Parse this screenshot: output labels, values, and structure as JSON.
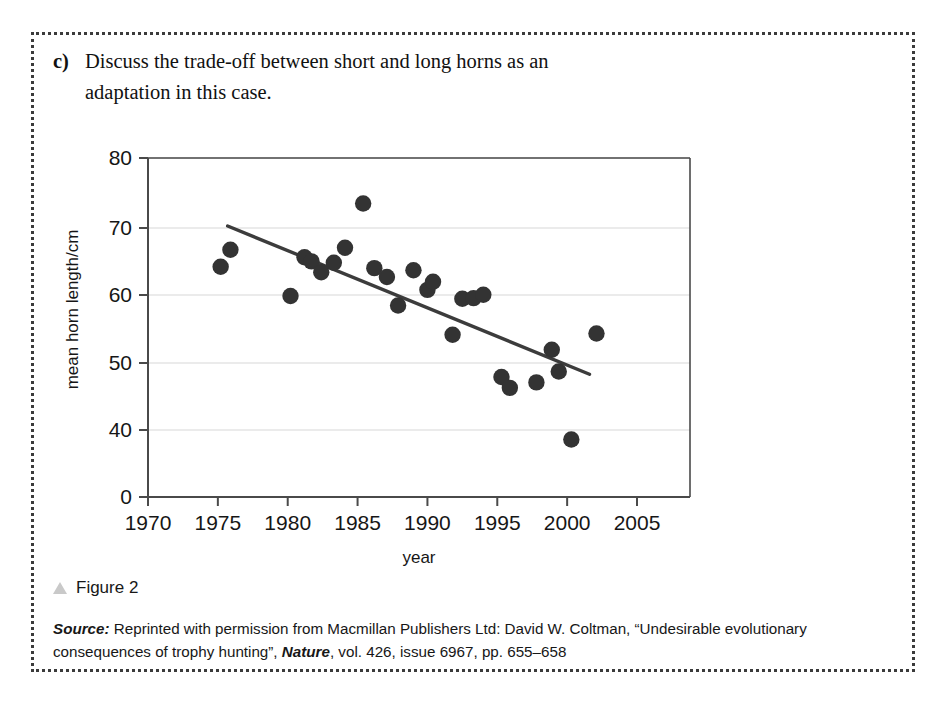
{
  "question": {
    "label": "c)",
    "line1": "Discuss the trade-off between short and long horns as an",
    "line2": "adaptation in this case."
  },
  "caption": {
    "icon": "triangle-icon",
    "text": "Figure 2"
  },
  "source": {
    "prefix": "Source:",
    "part1": " Reprinted with permission from Macmillan Publishers Ltd: David W. Coltman, “Undesirable evolutionary consequences of trophy hunting”, ",
    "journal": "Nature",
    "part2": ", vol. 426, issue 6967, pp. 655–658"
  },
  "colors": {
    "marker": "#333333",
    "trendline": "#3c3c3c",
    "gridline": "#d8d8d8",
    "axis": "#4a4a4a",
    "border": "#3b3b3b",
    "icon": "#c9c9c9"
  },
  "chart_data": {
    "type": "scatter",
    "title": "",
    "xlabel": "year",
    "ylabel": "mean horn length/cm",
    "xlim": [
      1970,
      2005
    ],
    "ylim": [
      0,
      80
    ],
    "xticks": [
      1970,
      1975,
      1980,
      1985,
      1990,
      1995,
      2000,
      2005
    ],
    "yticks": [
      0,
      40,
      50,
      60,
      70,
      80
    ],
    "y_axis_break": true,
    "grid": "horizontal",
    "legend": "none",
    "series": [
      {
        "name": "mean horn length",
        "marker": "filled-circle",
        "points": [
          {
            "x": 1975.2,
            "y": 64.0
          },
          {
            "x": 1975.9,
            "y": 66.5
          },
          {
            "x": 1980.2,
            "y": 59.7
          },
          {
            "x": 1981.2,
            "y": 65.4
          },
          {
            "x": 1981.7,
            "y": 64.8
          },
          {
            "x": 1982.4,
            "y": 63.2
          },
          {
            "x": 1983.3,
            "y": 64.6
          },
          {
            "x": 1984.1,
            "y": 66.8
          },
          {
            "x": 1985.4,
            "y": 73.3
          },
          {
            "x": 1986.2,
            "y": 63.8
          },
          {
            "x": 1987.1,
            "y": 62.5
          },
          {
            "x": 1987.9,
            "y": 58.3
          },
          {
            "x": 1989.0,
            "y": 63.5
          },
          {
            "x": 1990.0,
            "y": 60.6
          },
          {
            "x": 1990.4,
            "y": 61.8
          },
          {
            "x": 1991.8,
            "y": 54.0
          },
          {
            "x": 1992.5,
            "y": 59.3
          },
          {
            "x": 1993.3,
            "y": 59.4
          },
          {
            "x": 1994.0,
            "y": 59.9
          },
          {
            "x": 1995.3,
            "y": 47.8
          },
          {
            "x": 1995.9,
            "y": 46.2
          },
          {
            "x": 1997.8,
            "y": 47.0
          },
          {
            "x": 1998.9,
            "y": 51.8
          },
          {
            "x": 1999.4,
            "y": 48.6
          },
          {
            "x": 2000.3,
            "y": 38.6
          },
          {
            "x": 2002.1,
            "y": 54.2
          }
        ]
      }
    ],
    "trendline": {
      "name": "linear-regression",
      "x_start": 1975.7,
      "y_start": 70.0,
      "x_end": 2001.6,
      "y_end": 48.2
    }
  }
}
